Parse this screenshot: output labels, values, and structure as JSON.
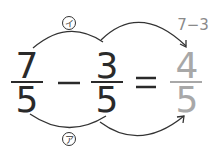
{
  "diagram": {
    "fraction_a": {
      "numerator": "7",
      "denominator": "5"
    },
    "operator": "−",
    "fraction_b": {
      "numerator": "3",
      "denominator": "5"
    },
    "equals": "=",
    "result": {
      "numerator": "4",
      "denominator": "5"
    },
    "numerator_calc": "7−3",
    "label_top": "イ",
    "label_bottom": "ア",
    "colors": {
      "main": "#2a2a2a",
      "result": "#a8a8a8",
      "calc": "#8a8a8a"
    }
  }
}
